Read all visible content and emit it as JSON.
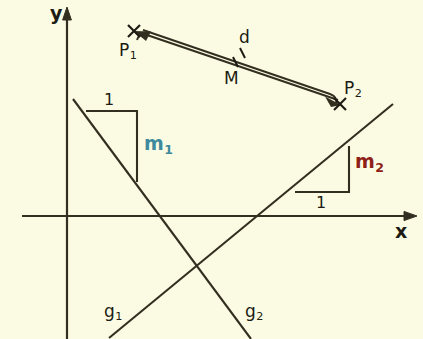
{
  "figure": {
    "kind": "geometry-diagram",
    "background_color": "#fbfbe3",
    "stroke_color": "#332f20",
    "axes": {
      "x_label": "x",
      "y_label": "y",
      "origin": [
        67,
        216
      ]
    },
    "points": [
      {
        "id": "P1",
        "base": "P",
        "sub": "1",
        "marker": "x",
        "at": [
          134,
          31
        ]
      },
      {
        "id": "P2",
        "base": "P",
        "sub": "2",
        "marker": "x",
        "at": [
          340,
          104
        ]
      },
      {
        "id": "M",
        "base": "M",
        "sub": "",
        "marker": "tick",
        "at": [
          238,
          69
        ]
      }
    ],
    "distance": {
      "label": "d",
      "from": "P1",
      "to": "P2",
      "style": "double-headed-arrow-pair"
    },
    "lines": [
      {
        "id": "g1",
        "base": "g",
        "sub": "1",
        "direction": "ascending",
        "slope_label": "m",
        "slope_sub": "2",
        "slope_color": "#8e2018",
        "run_label": "1",
        "from": [
          110,
          337
        ],
        "to": [
          392,
          105
        ]
      },
      {
        "id": "g2",
        "base": "g",
        "sub": "2",
        "direction": "descending",
        "slope_label": "m",
        "slope_sub": "1",
        "slope_color": "#3f8a9c",
        "run_label": "1",
        "from": [
          73,
          99
        ],
        "to": [
          250,
          339
        ]
      }
    ],
    "labels": {
      "y_axis": "y",
      "x_axis": "x",
      "d": "d",
      "M": "M",
      "one_top": "1",
      "one_bottom": "1",
      "m1_base": "m",
      "m1_sub": "1",
      "m2_base": "m",
      "m2_sub": "2",
      "g1_base": "g",
      "g1_sub": "1",
      "g2_base": "g",
      "g2_sub": "2",
      "P1_base": "P",
      "P1_sub": "1",
      "P2_base": "P",
      "P2_sub": "2"
    }
  }
}
